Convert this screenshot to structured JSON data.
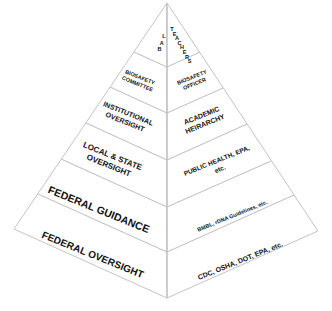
{
  "diagram": {
    "type": "pyramid",
    "colors": {
      "background": "#ffffff",
      "lines": "#c4c4c4",
      "text": "#111111"
    },
    "tiers": [
      {
        "left": "LAB",
        "right": "TEACHERS"
      },
      {
        "left": "BIOSAFETY\nCOMMITTEE",
        "right": "BIOSAFETY\nOFFICER"
      },
      {
        "left": "INSTITUTIONAL\nOVERSIGHT",
        "right": "ACADEMIC\nHEIRARCHY"
      },
      {
        "left": "LOCAL & STATE\nOVERSIGHT",
        "right": "PUBLIC HEALTH, EPA,\netc."
      },
      {
        "left": "FEDERAL GUIDANCE",
        "right": "BMBL, rDNA Guidelines, etc."
      },
      {
        "left": "FEDERAL OVERSIGHT",
        "right": "CDC, OSHA, DOT, EPA, etc."
      }
    ]
  }
}
